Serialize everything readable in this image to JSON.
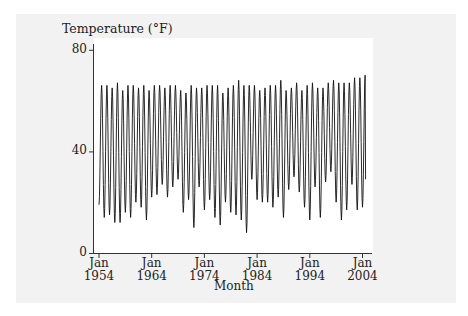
{
  "chart_data": {
    "type": "line",
    "title": "",
    "ylabel": "Temperature (°F)",
    "xlabel": "Month",
    "ylim": [
      0,
      80
    ],
    "xlim": [
      1953.6,
      2005.0
    ],
    "yticks": [
      0,
      40,
      80
    ],
    "ytick_labels": [
      "0",
      "40",
      "80"
    ],
    "xticks": [
      1954,
      1964,
      1974,
      1984,
      1994,
      2004
    ],
    "xtick_labels": [
      {
        "line1": "Jan",
        "line2": "1954"
      },
      {
        "line1": "Jan",
        "line2": "1964"
      },
      {
        "line1": "Jan",
        "line2": "1974"
      },
      {
        "line1": "Jan",
        "line2": "1984"
      },
      {
        "line1": "Jan",
        "line2": "1994"
      },
      {
        "line1": "Jan",
        "line2": "2004"
      }
    ],
    "grid": false,
    "legend": null,
    "series": [
      {
        "name": "Monthly mean temperature",
        "frequency": "monthly",
        "start": "Jan 1954",
        "end": "Jun 2004",
        "years": [
          1954,
          1955,
          1956,
          1957,
          1958,
          1959,
          1960,
          1961,
          1962,
          1963,
          1964,
          1965,
          1966,
          1967,
          1968,
          1969,
          1970,
          1971,
          1972,
          1973,
          1974,
          1975,
          1976,
          1977,
          1978,
          1979,
          1980,
          1981,
          1982,
          1983,
          1984,
          1985,
          1986,
          1987,
          1988,
          1989,
          1990,
          1991,
          1992,
          1993,
          1994,
          1995,
          1996,
          1997,
          1998,
          1999,
          2000,
          2001,
          2002,
          2003,
          2004
        ],
        "annual_max": [
          66,
          66,
          65,
          67,
          64,
          66,
          66,
          65,
          66,
          64,
          66,
          66,
          65,
          66,
          66,
          64,
          63,
          66,
          65,
          65,
          66,
          66,
          66,
          63,
          65,
          66,
          68,
          66,
          66,
          66,
          64,
          65,
          66,
          66,
          68,
          64,
          65,
          67,
          64,
          66,
          67,
          65,
          65,
          67,
          68,
          67,
          67,
          67,
          69,
          69,
          70
        ],
        "annual_min": [
          19,
          14,
          15,
          12,
          12,
          16,
          14,
          20,
          18,
          13,
          22,
          23,
          27,
          22,
          26,
          29,
          16,
          21,
          10,
          26,
          17,
          21,
          14,
          11,
          20,
          16,
          15,
          13,
          8,
          29,
          21,
          20,
          20,
          18,
          22,
          14,
          25,
          30,
          24,
          18,
          13,
          26,
          14,
          28,
          32,
          20,
          13,
          17,
          27,
          17,
          18
        ]
      }
    ]
  }
}
